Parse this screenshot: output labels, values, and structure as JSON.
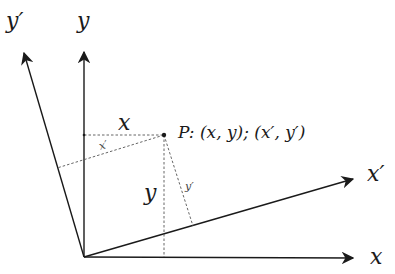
{
  "diagram": {
    "axes": {
      "x": {
        "label": "x"
      },
      "y": {
        "label": "y"
      },
      "x_prime": {
        "label": "x′"
      },
      "y_prime": {
        "label": "y′"
      }
    },
    "point": {
      "name": "P",
      "label": "P: (x, y); (x′, y′)"
    },
    "components": {
      "x": "x",
      "y": "y",
      "x_prime": "x′",
      "y_prime": "y′"
    },
    "colors": {
      "axis": "#1a1a1a",
      "dashed": "#555555",
      "background": "#ffffff"
    }
  }
}
